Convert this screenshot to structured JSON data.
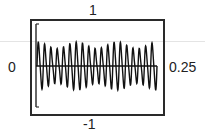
{
  "chart_data": {
    "type": "line",
    "title": "",
    "labels": {
      "top": "1",
      "bottom": "-1",
      "left": "0",
      "right": "0.25"
    },
    "xlabel": "",
    "ylabel": "",
    "xlim": [
      0,
      0.25
    ],
    "ylim": [
      -1,
      1
    ],
    "grid": false,
    "legend": null,
    "series": [
      {
        "name": "signal",
        "cycles": 19,
        "amplitude_range": [
          0.35,
          0.5
        ],
        "color": "#111111"
      }
    ],
    "baseline": 0
  },
  "colors": {
    "frame": "#2a2a2a",
    "signal": "#111111",
    "background": "#ffffff",
    "faint_line": "#e4e4e4"
  }
}
